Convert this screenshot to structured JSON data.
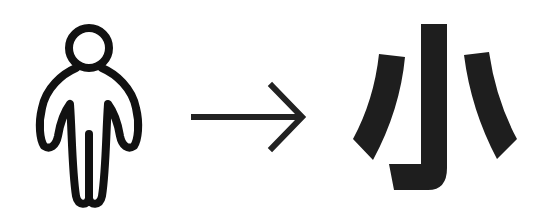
{
  "figure": {
    "source_glyph": "person-pictogram",
    "arrow": "right-arrow",
    "target_character": "小",
    "colors": {
      "ink": "#1a1a1a",
      "background": "#ffffff"
    }
  }
}
